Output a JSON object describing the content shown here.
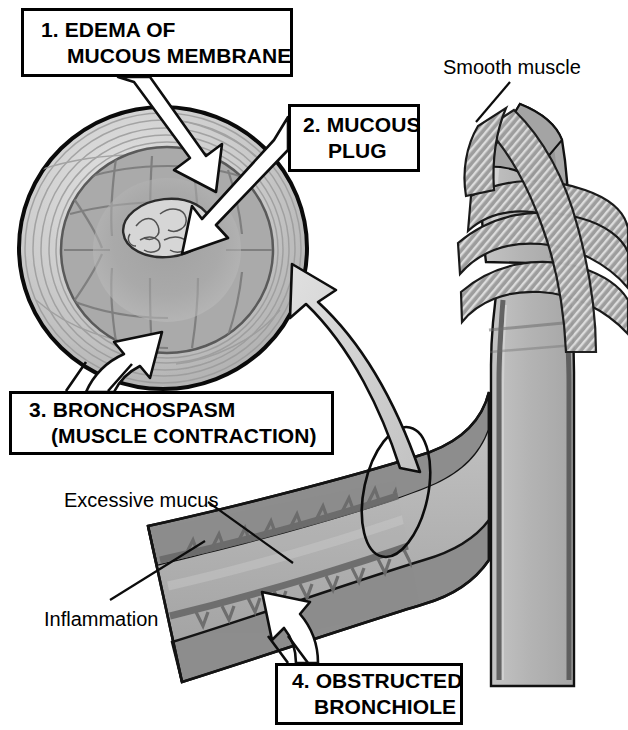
{
  "figure": {
    "background_color": "#ffffff",
    "width": 628,
    "height": 730
  },
  "callouts": [
    {
      "id": "edema",
      "number": "1.",
      "line1": "1. EDEMA OF",
      "line2": "MUCOUS MEMBRANE",
      "points_to": "airway-wall-cross-section"
    },
    {
      "id": "mucous-plug",
      "number": "2.",
      "line1": "2. MUCOUS",
      "line2": "PLUG",
      "points_to": "mucous-plug-lumen"
    },
    {
      "id": "bronchospasm",
      "number": "3.",
      "line1": "3. BRONCHOSPASM",
      "line2": "(MUSCLE CONTRACTION)",
      "points_to": "cross-section-muscle-layer"
    },
    {
      "id": "obstructed-bronchiole",
      "number": "4.",
      "line1": "4. OBSTRUCTED",
      "line2": "BRONCHIOLE",
      "points_to": "bronchiole-lumen"
    }
  ],
  "plain_labels": [
    {
      "id": "smooth-muscle",
      "text": "Smooth muscle"
    },
    {
      "id": "excessive-mucus",
      "text": "Excessive mucus"
    },
    {
      "id": "inflammation",
      "text": "Inflammation"
    }
  ],
  "colors": {
    "outline": "#000000",
    "box_border": "#000000",
    "box_fill": "#ffffff",
    "text": "#000000",
    "airway_lumen_fill": "#b6b6b6",
    "airway_wall_fill": "#8e8e8e",
    "muscle_band_fill": "#9a9a9a",
    "muscle_band_stripe": "#d8d8d8",
    "cross_section_outer": "#cfcfcf",
    "cross_section_mucosa": "#a8a8a8",
    "cross_section_deep": "#9a9a9a",
    "mucous_plug_fill": "#d4d4d4",
    "big_arrow_fill": "#d0d0d0",
    "white_arrow_fill": "#ffffff"
  },
  "structures": [
    {
      "id": "cross-section",
      "name": "Bronchiole cross section (magnified)"
    },
    {
      "id": "mucous-plug",
      "name": "Mucous plug in lumen"
    },
    {
      "id": "trachea-bronchus",
      "name": "Bronchus with smooth muscle bands"
    },
    {
      "id": "obstructed-bronchiole",
      "name": "Longitudinal obstructed bronchiole"
    },
    {
      "id": "magnifier-ellipse",
      "name": "Magnification indicator ellipse"
    },
    {
      "id": "magnify-arrow",
      "name": "Curved magnification arrow"
    }
  ]
}
